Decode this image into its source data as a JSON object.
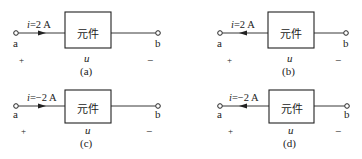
{
  "figure": {
    "panels": [
      {
        "id": "a",
        "caption": "(a)",
        "current_var": "i",
        "current_value": "=2 A",
        "arrow_direction": "right",
        "element_label": "元件",
        "voltage_label": "u",
        "terminal_left": "a",
        "terminal_right": "b",
        "plus": "+",
        "minus": "−"
      },
      {
        "id": "b",
        "caption": "(b)",
        "current_var": "i",
        "current_value": "=2 A",
        "arrow_direction": "left",
        "element_label": "元件",
        "voltage_label": "u",
        "terminal_left": "a",
        "terminal_right": "b",
        "plus": "+",
        "minus": "−"
      },
      {
        "id": "c",
        "caption": "(c)",
        "current_var": "i",
        "current_value": "=−2 A",
        "arrow_direction": "right",
        "element_label": "元件",
        "voltage_label": "u",
        "terminal_left": "a",
        "terminal_right": "b",
        "plus": "+",
        "minus": "−"
      },
      {
        "id": "d",
        "caption": "(d)",
        "current_var": "i",
        "current_value": "=−2 A",
        "arrow_direction": "left",
        "element_label": "元件",
        "voltage_label": "u",
        "terminal_left": "a",
        "terminal_right": "b",
        "plus": "+",
        "minus": "−"
      }
    ]
  }
}
